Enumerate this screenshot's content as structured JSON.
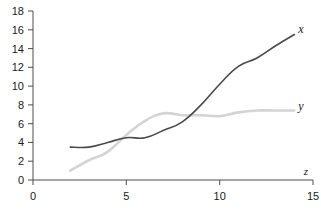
{
  "chart_data": {
    "type": "line",
    "title": "",
    "subtitle": "",
    "xlabel": "z",
    "ylabel": "",
    "xlim": [
      0,
      15
    ],
    "ylim": [
      0,
      18
    ],
    "grid": false,
    "legend_position": "right-end-of-line",
    "x_ticks": [
      "0",
      "5",
      "10",
      "15"
    ],
    "x_tick_values": [
      0,
      5,
      10,
      15
    ],
    "y_ticks": [
      "0",
      "2",
      "4",
      "6",
      "8",
      "10",
      "12",
      "14",
      "16",
      "18"
    ],
    "y_tick_values": [
      0,
      2,
      4,
      6,
      8,
      10,
      12,
      14,
      16,
      18
    ],
    "series": [
      {
        "name": "x",
        "label": "x",
        "color": "#4a4a4a",
        "x": [
          2,
          3,
          4,
          5,
          6,
          7,
          8,
          9,
          10,
          11,
          12,
          13,
          14
        ],
        "values": [
          3.5,
          3.5,
          4.0,
          4.5,
          4.5,
          5.3,
          6.2,
          8.0,
          10.2,
          12.1,
          13.0,
          14.3,
          15.5
        ]
      },
      {
        "name": "y",
        "label": "y",
        "color": "#d4d4d4",
        "x": [
          2,
          3,
          4,
          5,
          6,
          7,
          8,
          9,
          10,
          11,
          12,
          13,
          14
        ],
        "values": [
          1.0,
          2.1,
          3.0,
          4.8,
          6.3,
          7.1,
          6.9,
          6.9,
          6.8,
          7.2,
          7.4,
          7.4,
          7.4
        ]
      }
    ]
  },
  "labels": {
    "x_axis_title": "z",
    "series_x": "x",
    "series_y": "y"
  }
}
